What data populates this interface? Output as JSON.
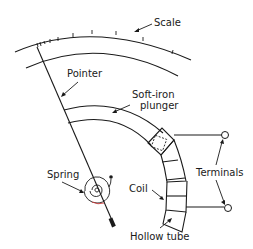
{
  "diagram": {
    "labels": {
      "scale": "Scale",
      "pointer": "Pointer",
      "plunger_line1": "Soft-iron",
      "plunger_line2": "plunger",
      "spring": "Spring",
      "coil": "Coil",
      "terminals": "Terminals",
      "hollow_tube": "Hollow tube"
    },
    "colors": {
      "ink": "#1a1a1a",
      "background": "#ffffff",
      "accent_red": "#d04040"
    }
  }
}
